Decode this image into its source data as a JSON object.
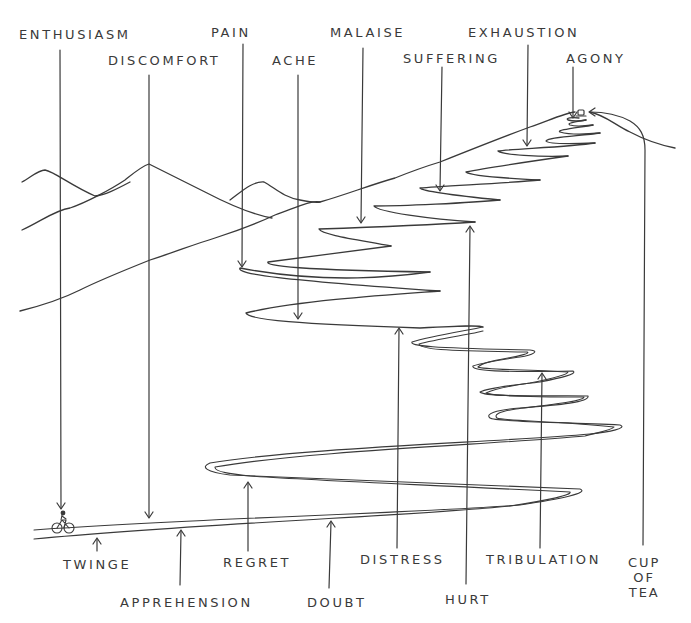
{
  "illustration": {
    "subject": "cyclist climbing switchback mountain road",
    "stroke_color": "#3a3a3a",
    "background": "#ffffff",
    "summit_reward": "cup of tea"
  },
  "labels_top": [
    {
      "id": "enthusiasm",
      "text": "ENTHUSIASM",
      "x": 19,
      "y": 28
    },
    {
      "id": "pain",
      "text": "PAIN",
      "x": 211,
      "y": 26
    },
    {
      "id": "malaise",
      "text": "MALAISE",
      "x": 330,
      "y": 26
    },
    {
      "id": "exhaustion",
      "text": "EXHAUSTION",
      "x": 468,
      "y": 26
    },
    {
      "id": "discomfort",
      "text": "DISCOMFORT",
      "x": 108,
      "y": 54
    },
    {
      "id": "ache",
      "text": "ACHE",
      "x": 272,
      "y": 54
    },
    {
      "id": "suffering",
      "text": "SUFFERING",
      "x": 403,
      "y": 52
    },
    {
      "id": "agony",
      "text": "AGONY",
      "x": 566,
      "y": 52
    }
  ],
  "labels_bottom": [
    {
      "id": "twinge",
      "text": "TWINGE",
      "x": 63,
      "y": 558
    },
    {
      "id": "regret",
      "text": "REGRET",
      "x": 223,
      "y": 556
    },
    {
      "id": "distress",
      "text": "DISTRESS",
      "x": 360,
      "y": 553
    },
    {
      "id": "tribulation",
      "text": "TRIBULATION",
      "x": 486,
      "y": 553
    },
    {
      "id": "apprehension",
      "text": "APPREHENSION",
      "x": 120,
      "y": 596
    },
    {
      "id": "doubt",
      "text": "DOUBT",
      "x": 307,
      "y": 596
    },
    {
      "id": "hurt",
      "text": "HURT",
      "x": 445,
      "y": 593
    },
    {
      "id": "cup_of_tea",
      "text": "CUP\nOF\nTEA",
      "x": 630,
      "y": 556
    }
  ],
  "journey_order": [
    "ENTHUSIASM",
    "TWINGE",
    "DISCOMFORT",
    "APPREHENSION",
    "REGRET",
    "DOUBT",
    "DISTRESS",
    "HURT",
    "TRIBULATION",
    "ACHE",
    "PAIN",
    "MALAISE",
    "SUFFERING",
    "EXHAUSTION",
    "AGONY",
    "CUP OF TEA"
  ]
}
